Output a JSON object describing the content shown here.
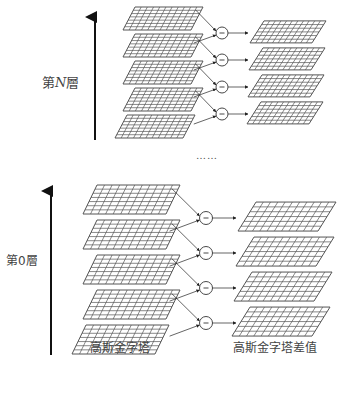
{
  "diagram": {
    "top_level_label": {
      "prefix": "第",
      "var": "N",
      "suffix": "層"
    },
    "bottom_level_label": "第0層",
    "ellipsis": "……",
    "left_column_caption": "高斯金字塔",
    "right_column_caption": "高斯金字塔差值",
    "figure_caption_partial": "",
    "operator_symbol": "−",
    "levels": [
      {
        "name": "top-pyramid-level-N",
        "gaussian_layers": 5,
        "difference_layers": 4
      },
      {
        "name": "bottom-pyramid-level-0",
        "gaussian_layers": 5,
        "difference_layers": 4
      }
    ],
    "colors": {
      "grid_stroke": "#555555",
      "grid_fill": "#ffffff",
      "arrow": "#222222",
      "axis_arrow": "#111111"
    }
  }
}
